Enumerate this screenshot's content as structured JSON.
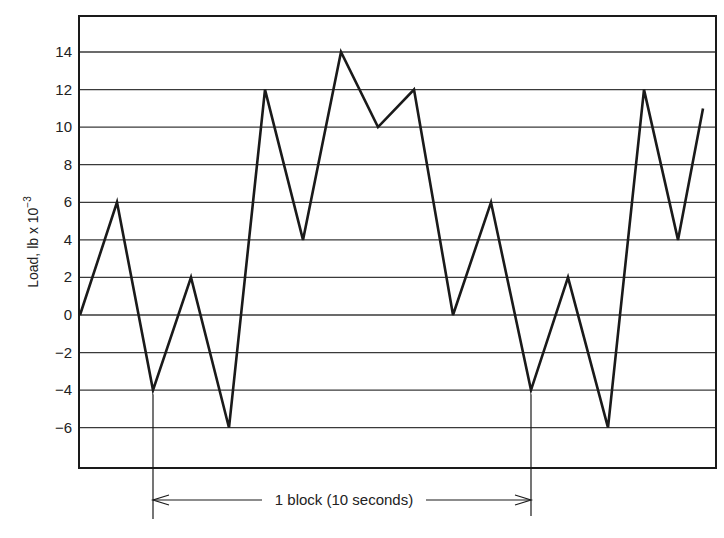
{
  "chart_data": {
    "type": "line",
    "title": "",
    "xlabel": "",
    "ylabel": "Load, lb x 10",
    "ylabel_exponent": "−3",
    "ylim": [
      -8,
      16
    ],
    "yticks": [
      14,
      12,
      10,
      8,
      6,
      4,
      2,
      0,
      -2,
      -4,
      -6
    ],
    "ytick_labels": [
      "14",
      "12",
      "10",
      "8",
      "6",
      "4",
      "2",
      "0",
      "−2",
      "−4",
      "−6"
    ],
    "grid": true,
    "legend": null,
    "x": [
      0,
      1,
      2,
      3,
      4,
      5,
      6,
      7,
      8,
      9,
      10,
      11,
      12,
      13,
      14,
      15,
      16,
      17
    ],
    "series": [
      {
        "name": "Load history",
        "values": [
          0,
          6,
          -4,
          2,
          -6,
          12,
          4,
          14,
          10,
          12,
          0,
          6,
          -4,
          2,
          -6,
          12,
          4,
          11
        ]
      }
    ],
    "annotations": [
      {
        "type": "span-arrow",
        "text": "1 block (10 seconds)",
        "from_point_index": 2,
        "to_point_index": 12
      }
    ]
  },
  "axis": {
    "ylabel": "Load, lb x 10",
    "ylabel_exponent": "−3"
  },
  "annotation": {
    "block_label": "1 block (10 seconds)"
  },
  "colors": {
    "line": "#1a1a1a",
    "grid": "#3a3a3a",
    "frame": "#1a1a1a",
    "background": "#ffffff"
  }
}
